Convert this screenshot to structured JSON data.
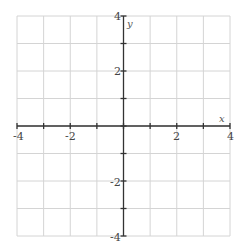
{
  "chart_data": {
    "type": "line",
    "title": "",
    "xlabel": "x",
    "ylabel": "y",
    "xlim": [
      -4,
      4
    ],
    "ylim": [
      -4,
      4
    ],
    "grid": true,
    "grid_step": 1,
    "x_tick_labels": [
      "-4",
      "-2",
      "2",
      "4"
    ],
    "y_tick_labels": [
      "4",
      "2",
      "-2",
      "-4"
    ],
    "series": []
  }
}
